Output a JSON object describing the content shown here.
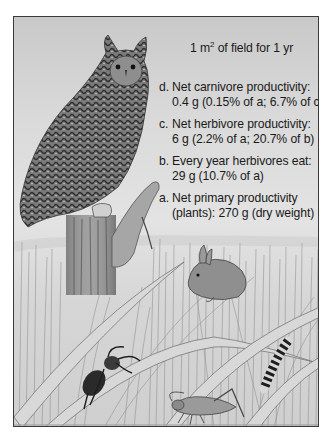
{
  "figure": {
    "title": {
      "prefix": "1 m",
      "superscript": "2",
      "suffix": " of field for 1 yr"
    },
    "items": [
      {
        "letter": "d.",
        "line1": "Net carnivore productivity:",
        "line2": "0.4 g (0.15% of a; 6.7% of c)"
      },
      {
        "letter": "c.",
        "line1": "Net herbivore productivity:",
        "line2": "6 g (2.2% of a; 20.7% of b)"
      },
      {
        "letter": "b.",
        "line1": "Every year herbivores eat:",
        "line2": "29 g (10.7% of a)"
      },
      {
        "letter": "a.",
        "line1": "Net primary productivity",
        "line2": "(plants): 270 g (dry weight)"
      }
    ],
    "illustration": {
      "subjects": [
        "owl",
        "fence-post",
        "mouse-prey",
        "rabbit",
        "spider",
        "grasshopper",
        "caterpillar",
        "grass-field"
      ]
    },
    "colors": {
      "frame_border": "#3a3a3a",
      "text": "#1a1a1a",
      "sky_top": "#c9c9c9",
      "sky_mid": "#e3e3e3"
    }
  }
}
